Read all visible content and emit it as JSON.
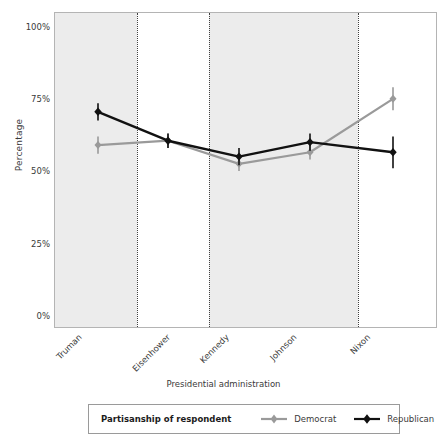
{
  "chart_data": {
    "type": "line",
    "title": "",
    "subtitle": "",
    "xlabel": "Presidential administration",
    "ylabel": "Percentage",
    "categories": [
      "Truman",
      "Eisenhower",
      "Kennedy",
      "Johnson",
      "Nixon"
    ],
    "ylim": [
      0,
      100
    ],
    "yticks": [
      0,
      25,
      50,
      75,
      100
    ],
    "ytick_labels": [
      "0%",
      "25%",
      "50%",
      "75%",
      "100%"
    ],
    "grid": false,
    "legend_position": "bottom",
    "legend_title": "Partisanship of respondent",
    "error_bars": true,
    "series": [
      {
        "name": "Democrat",
        "color": "#9a9a9a",
        "marker": "diamond",
        "values": [
          59.5,
          61.0,
          53.0,
          57.0,
          75.5
        ],
        "error_low": [
          56.5,
          58.5,
          50.5,
          54.5,
          71.5
        ],
        "error_high": [
          62.5,
          63.5,
          55.5,
          59.5,
          79.5
        ]
      },
      {
        "name": "Republican",
        "color": "#111111",
        "marker": "diamond",
        "values": [
          71.0,
          61.0,
          55.5,
          60.5,
          57.0
        ],
        "error_low": [
          68.0,
          58.5,
          52.5,
          57.5,
          51.5
        ],
        "error_high": [
          74.0,
          63.5,
          58.5,
          63.5,
          62.5
        ]
      }
    ],
    "annotations": {
      "shaded_bands": [
        {
          "from_category": "Truman",
          "to_category": "Truman",
          "note": "administration band shading"
        },
        {
          "from_category": "Kennedy",
          "to_category": "Johnson",
          "note": "administration band shading"
        }
      ],
      "divider_lines": [
        {
          "after_category": "Truman"
        },
        {
          "after_category": "Eisenhower"
        },
        {
          "after_category": "Johnson"
        }
      ]
    }
  },
  "axes": {
    "y_title": "Percentage",
    "x_title": "Presidential administration",
    "y_ticks": [
      {
        "label": "100%"
      },
      {
        "label": "75%"
      },
      {
        "label": "50%"
      },
      {
        "label": "25%"
      },
      {
        "label": "0%"
      }
    ],
    "x_ticks": [
      {
        "label": "Truman"
      },
      {
        "label": "Eisenhower"
      },
      {
        "label": "Kennedy"
      },
      {
        "label": "Johnson"
      },
      {
        "label": "Nixon"
      }
    ]
  },
  "legend": {
    "title": "Partisanship of respondent",
    "entries": [
      {
        "label": "Democrat",
        "color": "#9a9a9a"
      },
      {
        "label": "Republican",
        "color": "#111111"
      }
    ]
  },
  "colors": {
    "democrat": "#9a9a9a",
    "republican": "#111111",
    "band": "#ececec",
    "frame": "#b4b4b4",
    "text": "#3a3a3a"
  }
}
